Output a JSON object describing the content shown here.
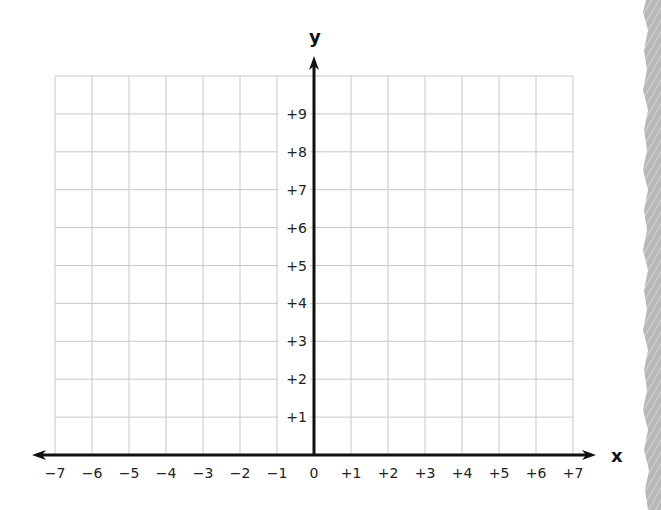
{
  "chart_data": {
    "type": "scatter",
    "title": "",
    "xlabel": "x",
    "ylabel": "y",
    "xlim": [
      -7,
      7
    ],
    "ylim": [
      0,
      10
    ],
    "grid": true,
    "x_ticks": [
      "−7",
      "−6",
      "−5",
      "−4",
      "−3",
      "−2",
      "−1",
      "0",
      "+1",
      "+2",
      "+3",
      "+4",
      "+5",
      "+6",
      "+7"
    ],
    "y_ticks": [
      "+1",
      "+2",
      "+3",
      "+4",
      "+5",
      "+6",
      "+7",
      "+8",
      "+9"
    ],
    "series": [],
    "legend": null
  },
  "labels": {
    "x_axis": "x",
    "y_axis": "y"
  },
  "colors": {
    "grid": "#c8c8c8",
    "axis": "#111111",
    "decoration": "#b5b5b5"
  }
}
